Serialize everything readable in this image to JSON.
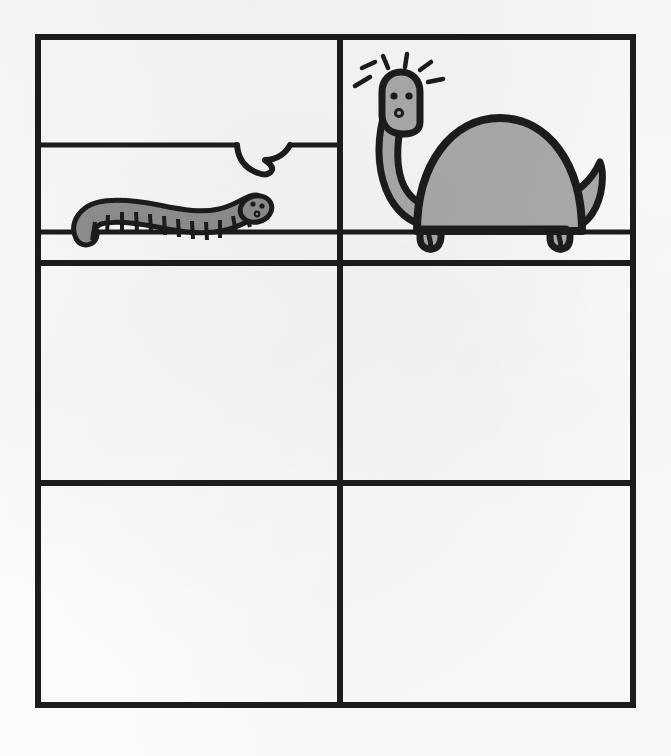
{
  "artwork": {
    "title": "Six-panel comic grid",
    "medium": "ink and gray marker line drawing on paper",
    "background_color": "#fcfbf9",
    "ink_color": "#1c1c1c",
    "fill_gray": "#ababab",
    "panel_count": 6,
    "columns": 2,
    "rows": 3,
    "filled_panels": 1,
    "empty_panels": 5
  },
  "frame": {
    "x": 38,
    "y": 37,
    "width": 595,
    "height": 668,
    "border_width": 6
  },
  "grid": {
    "vertical_divider_x": 340,
    "row_divider_1_y": 263,
    "row_divider_2_y": 483,
    "divider_width": 6,
    "inner_rule_top_y": 145,
    "inner_rule_ground_y": 232,
    "inner_rule_width": 5
  },
  "panels": [
    {
      "id": "panel-1",
      "name": "top-left",
      "row": 1,
      "column": 1,
      "contents": "worm on ground line with speech balloon tail",
      "empty": false
    },
    {
      "id": "panel-2",
      "name": "top-right",
      "row": 1,
      "column": 2,
      "contents": "gray sauropod dinosaur, startled",
      "empty": false
    },
    {
      "id": "panel-3",
      "name": "middle-left",
      "row": 2,
      "column": 1,
      "contents": "blank",
      "empty": true
    },
    {
      "id": "panel-4",
      "name": "middle-right",
      "row": 2,
      "column": 2,
      "contents": "blank",
      "empty": true
    },
    {
      "id": "panel-5",
      "name": "bottom-left",
      "row": 3,
      "column": 1,
      "contents": "blank",
      "empty": true
    },
    {
      "id": "panel-6",
      "name": "bottom-right",
      "row": 3,
      "column": 2,
      "contents": "blank",
      "empty": true
    }
  ],
  "worm": {
    "label": "worm",
    "segment_count": 12,
    "body_fill": "#8f8f8f",
    "outline": "#1c1c1c",
    "eye_count": 2,
    "has_mouth": true,
    "facing": "right",
    "baseline_y": 232,
    "left_x": 76,
    "right_x": 272
  },
  "speech_balloon": {
    "label": "speech balloon tail",
    "style": "tail only, balloon body formed by the panel rule",
    "tail_tip_x": 265,
    "tail_tip_y": 172,
    "attached_rule_y": 145
  },
  "dinosaur": {
    "label": "sauropod dinosaur",
    "body_fill": "#ababab",
    "outline": "#1c1c1c",
    "eye_count": 2,
    "has_nostril": true,
    "surprise_line_count": 5,
    "leg_count": 2,
    "toes_per_foot": 2,
    "has_long_neck": true,
    "has_curled_tail": true,
    "facing": "left",
    "ground_y": 232
  },
  "labels": {
    "alt": "Hand drawn comic page: a worm speaks to a startled dinosaur in the top two panels; four lower panels are blank."
  }
}
